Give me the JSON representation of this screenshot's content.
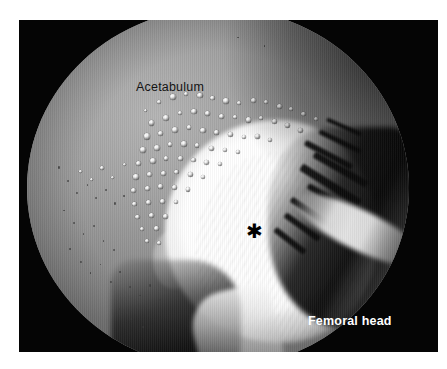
{
  "figure": {
    "kind": "hip-arthroscopy-photograph",
    "modality": "arthroscopy",
    "background_color": "#ffffff",
    "frame_color": "#050505",
    "labels": [
      {
        "id": "acetabulum",
        "text": "Acetabulum",
        "color": "#141414",
        "weight": "normal"
      },
      {
        "id": "femoral-head",
        "text": "Femoral head",
        "color": "#ffffff",
        "weight": "bold"
      }
    ],
    "markers": [
      {
        "id": "asterisk",
        "glyph": "✱",
        "color": "#000000",
        "meaning": "region-of-interest on femoral head"
      }
    ],
    "regions": {
      "acetabulum_tone": "#a2a2a2",
      "femoral_head_tone": "#ffffff",
      "shadow_tone": "#050505"
    }
  },
  "bubbles": [
    {
      "x": 30.5,
      "y": 28.0,
      "d": 3.0
    },
    {
      "x": 34.0,
      "y": 25.5,
      "d": 4.6
    },
    {
      "x": 37.5,
      "y": 24.0,
      "d": 5.4
    },
    {
      "x": 41.0,
      "y": 23.2,
      "d": 4.8
    },
    {
      "x": 44.6,
      "y": 23.6,
      "d": 5.2
    },
    {
      "x": 48.0,
      "y": 24.4,
      "d": 4.2
    },
    {
      "x": 51.4,
      "y": 25.0,
      "d": 5.6
    },
    {
      "x": 55.0,
      "y": 25.8,
      "d": 4.4
    },
    {
      "x": 58.6,
      "y": 25.0,
      "d": 5.0
    },
    {
      "x": 62.0,
      "y": 25.6,
      "d": 4.2
    },
    {
      "x": 65.4,
      "y": 26.6,
      "d": 5.4
    },
    {
      "x": 68.6,
      "y": 27.6,
      "d": 4.0
    },
    {
      "x": 71.8,
      "y": 28.8,
      "d": 4.8
    },
    {
      "x": 75.0,
      "y": 30.2,
      "d": 4.2
    },
    {
      "x": 32.0,
      "y": 31.2,
      "d": 5.2
    },
    {
      "x": 35.6,
      "y": 29.8,
      "d": 6.0
    },
    {
      "x": 39.4,
      "y": 28.6,
      "d": 4.4
    },
    {
      "x": 43.0,
      "y": 28.0,
      "d": 5.6
    },
    {
      "x": 46.6,
      "y": 28.6,
      "d": 4.6
    },
    {
      "x": 50.2,
      "y": 29.4,
      "d": 5.2
    },
    {
      "x": 53.8,
      "y": 29.8,
      "d": 4.0
    },
    {
      "x": 57.2,
      "y": 30.4,
      "d": 5.4
    },
    {
      "x": 60.8,
      "y": 30.0,
      "d": 4.2
    },
    {
      "x": 64.2,
      "y": 30.8,
      "d": 5.0
    },
    {
      "x": 67.6,
      "y": 32.0,
      "d": 4.4
    },
    {
      "x": 71.0,
      "y": 33.4,
      "d": 4.8
    },
    {
      "x": 30.6,
      "y": 34.8,
      "d": 6.4
    },
    {
      "x": 34.4,
      "y": 34.2,
      "d": 5.0
    },
    {
      "x": 38.0,
      "y": 33.0,
      "d": 5.8
    },
    {
      "x": 41.8,
      "y": 32.6,
      "d": 4.4
    },
    {
      "x": 45.4,
      "y": 33.2,
      "d": 5.2
    },
    {
      "x": 49.0,
      "y": 34.0,
      "d": 4.6
    },
    {
      "x": 52.6,
      "y": 34.4,
      "d": 5.0
    },
    {
      "x": 56.2,
      "y": 35.2,
      "d": 4.2
    },
    {
      "x": 59.8,
      "y": 35.0,
      "d": 4.6
    },
    {
      "x": 63.2,
      "y": 36.0,
      "d": 4.0
    },
    {
      "x": 29.6,
      "y": 38.6,
      "d": 5.6
    },
    {
      "x": 33.2,
      "y": 38.0,
      "d": 6.2
    },
    {
      "x": 36.8,
      "y": 37.2,
      "d": 4.8
    },
    {
      "x": 40.4,
      "y": 37.0,
      "d": 5.4
    },
    {
      "x": 44.0,
      "y": 37.6,
      "d": 4.4
    },
    {
      "x": 47.6,
      "y": 38.2,
      "d": 5.0
    },
    {
      "x": 51.2,
      "y": 38.8,
      "d": 4.2
    },
    {
      "x": 54.6,
      "y": 39.4,
      "d": 4.6
    },
    {
      "x": 28.6,
      "y": 42.4,
      "d": 5.0
    },
    {
      "x": 32.2,
      "y": 41.8,
      "d": 5.8
    },
    {
      "x": 35.8,
      "y": 41.2,
      "d": 4.6
    },
    {
      "x": 39.4,
      "y": 41.0,
      "d": 5.2
    },
    {
      "x": 43.0,
      "y": 41.6,
      "d": 4.4
    },
    {
      "x": 46.4,
      "y": 42.2,
      "d": 4.8
    },
    {
      "x": 50.0,
      "y": 42.8,
      "d": 4.0
    },
    {
      "x": 27.8,
      "y": 46.2,
      "d": 5.4
    },
    {
      "x": 31.4,
      "y": 45.6,
      "d": 4.8
    },
    {
      "x": 35.0,
      "y": 45.2,
      "d": 5.6
    },
    {
      "x": 38.6,
      "y": 45.0,
      "d": 4.4
    },
    {
      "x": 42.2,
      "y": 45.6,
      "d": 5.0
    },
    {
      "x": 45.6,
      "y": 46.4,
      "d": 4.2
    },
    {
      "x": 27.2,
      "y": 50.0,
      "d": 5.0
    },
    {
      "x": 30.8,
      "y": 49.4,
      "d": 5.6
    },
    {
      "x": 34.4,
      "y": 49.0,
      "d": 4.6
    },
    {
      "x": 38.0,
      "y": 49.2,
      "d": 5.2
    },
    {
      "x": 41.6,
      "y": 49.8,
      "d": 4.4
    },
    {
      "x": 27.6,
      "y": 53.8,
      "d": 4.6
    },
    {
      "x": 31.2,
      "y": 53.2,
      "d": 5.2
    },
    {
      "x": 34.8,
      "y": 53.0,
      "d": 4.8
    },
    {
      "x": 38.4,
      "y": 53.4,
      "d": 4.2
    },
    {
      "x": 28.4,
      "y": 57.4,
      "d": 4.4
    },
    {
      "x": 32.0,
      "y": 57.0,
      "d": 5.0
    },
    {
      "x": 35.6,
      "y": 57.2,
      "d": 4.6
    },
    {
      "x": 29.6,
      "y": 60.8,
      "d": 4.2
    },
    {
      "x": 33.2,
      "y": 60.6,
      "d": 4.8
    },
    {
      "x": 30.8,
      "y": 64.2,
      "d": 4.0
    },
    {
      "x": 34.0,
      "y": 64.6,
      "d": 4.4
    },
    {
      "x": 25.0,
      "y": 43.0,
      "d": 3.6
    },
    {
      "x": 22.0,
      "y": 46.6,
      "d": 3.2
    },
    {
      "x": 19.2,
      "y": 44.0,
      "d": 3.4
    },
    {
      "x": 16.4,
      "y": 47.2,
      "d": 3.0
    },
    {
      "x": 13.6,
      "y": 45.0,
      "d": 2.8
    }
  ],
  "specks": [
    {
      "x": 8.0,
      "y": 44.0,
      "d": 2.2
    },
    {
      "x": 10.6,
      "y": 47.8,
      "d": 1.8
    },
    {
      "x": 12.8,
      "y": 51.0,
      "d": 2.4
    },
    {
      "x": 15.6,
      "y": 49.0,
      "d": 1.6
    },
    {
      "x": 17.8,
      "y": 52.6,
      "d": 2.0
    },
    {
      "x": 20.4,
      "y": 50.4,
      "d": 1.8
    },
    {
      "x": 22.8,
      "y": 54.0,
      "d": 2.2
    },
    {
      "x": 25.2,
      "y": 52.0,
      "d": 1.6
    },
    {
      "x": 9.4,
      "y": 56.0,
      "d": 1.8
    },
    {
      "x": 12.0,
      "y": 59.4,
      "d": 2.0
    },
    {
      "x": 14.6,
      "y": 62.6,
      "d": 1.6
    },
    {
      "x": 17.2,
      "y": 60.2,
      "d": 2.2
    },
    {
      "x": 19.8,
      "y": 64.4,
      "d": 1.8
    },
    {
      "x": 22.4,
      "y": 67.0,
      "d": 2.0
    },
    {
      "x": 11.0,
      "y": 66.8,
      "d": 1.6
    },
    {
      "x": 13.8,
      "y": 70.2,
      "d": 2.0
    },
    {
      "x": 16.4,
      "y": 73.4,
      "d": 1.8
    },
    {
      "x": 19.0,
      "y": 71.0,
      "d": 1.6
    },
    {
      "x": 21.6,
      "y": 75.8,
      "d": 2.2
    },
    {
      "x": 24.2,
      "y": 73.0,
      "d": 1.8
    },
    {
      "x": 26.8,
      "y": 77.2,
      "d": 2.0
    },
    {
      "x": 29.4,
      "y": 79.6,
      "d": 1.6
    },
    {
      "x": 32.0,
      "y": 76.8,
      "d": 2.2
    },
    {
      "x": 34.6,
      "y": 80.8,
      "d": 1.8
    },
    {
      "x": 9.2,
      "y": 17.0,
      "d": 1.8
    },
    {
      "x": 6.8,
      "y": 21.0,
      "d": 1.6
    },
    {
      "x": 11.4,
      "y": 13.0,
      "d": 1.4
    },
    {
      "x": 55.0,
      "y": 8.0,
      "d": 1.6
    },
    {
      "x": 62.0,
      "y": 10.4,
      "d": 1.4
    },
    {
      "x": 27.0,
      "y": 86.0,
      "d": 2.0
    },
    {
      "x": 30.2,
      "y": 88.4,
      "d": 1.8
    },
    {
      "x": 24.0,
      "y": 83.4,
      "d": 1.6
    }
  ],
  "shadow_streaks": [
    {
      "x": 72.0,
      "y": 40.0,
      "w": 14.0,
      "h": 1.6,
      "rot": 28
    },
    {
      "x": 74.0,
      "y": 44.0,
      "w": 16.0,
      "h": 2.0,
      "rot": 30
    },
    {
      "x": 70.5,
      "y": 48.0,
      "w": 18.0,
      "h": 2.2,
      "rot": 32
    },
    {
      "x": 72.5,
      "y": 52.5,
      "w": 15.0,
      "h": 1.8,
      "rot": 30
    },
    {
      "x": 76.0,
      "y": 36.5,
      "w": 12.0,
      "h": 1.4,
      "rot": 26
    },
    {
      "x": 68.0,
      "y": 56.0,
      "w": 13.0,
      "h": 1.6,
      "rot": 34
    },
    {
      "x": 66.5,
      "y": 60.0,
      "w": 11.0,
      "h": 1.8,
      "rot": 36
    },
    {
      "x": 64.0,
      "y": 64.0,
      "w": 10.0,
      "h": 1.6,
      "rot": 38
    },
    {
      "x": 78.0,
      "y": 32.5,
      "w": 10.0,
      "h": 1.2,
      "rot": 24
    }
  ]
}
